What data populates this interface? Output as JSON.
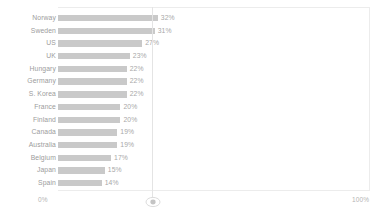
{
  "chart_data": {
    "type": "bar",
    "orientation": "horizontal",
    "title": "",
    "subtitle": "",
    "xlabel": "",
    "ylabel": "",
    "xlim": [
      0,
      100
    ],
    "grid": false,
    "legend": null,
    "bar_color": "#c9c9c9",
    "label_color": "#9c9c9c",
    "value_label_color": "#a8a8a8",
    "axis_color": "#ececec",
    "value_suffix": "%",
    "axis_ticks": [
      {
        "value": 0,
        "label": "0%"
      },
      {
        "value": 100,
        "label": "100%"
      }
    ],
    "categories": [
      "Norway",
      "Sweden",
      "US",
      "UK",
      "Hungary",
      "Germany",
      "S. Korea",
      "France",
      "Finland",
      "Canada",
      "Australia",
      "Belgium",
      "Japan",
      "Spain"
    ],
    "values": [
      32,
      31,
      27,
      23,
      22,
      22,
      22,
      20,
      20,
      19,
      19,
      17,
      15,
      14
    ],
    "data_labels": [
      "32%",
      "31%",
      "27%",
      "23%",
      "22%",
      "22%",
      "22%",
      "20%",
      "20%",
      "19%",
      "19%",
      "17%",
      "15%",
      "14%"
    ],
    "rows": [
      {
        "category": "Norway",
        "value": 32,
        "label": "32%"
      },
      {
        "category": "Sweden",
        "value": 31,
        "label": "31%"
      },
      {
        "category": "US",
        "value": 27,
        "label": "27%"
      },
      {
        "category": "UK",
        "value": 23,
        "label": "23%"
      },
      {
        "category": "Hungary",
        "value": 22,
        "label": "22%"
      },
      {
        "category": "Germany",
        "value": 22,
        "label": "22%"
      },
      {
        "category": "S. Korea",
        "value": 22,
        "label": "22%"
      },
      {
        "category": "France",
        "value": 20,
        "label": "20%"
      },
      {
        "category": "Finland",
        "value": 20,
        "label": "20%"
      },
      {
        "category": "Canada",
        "value": 19,
        "label": "19%"
      },
      {
        "category": "Australia",
        "value": 19,
        "label": "19%"
      },
      {
        "category": "Belgium",
        "value": 17,
        "label": "17%"
      },
      {
        "category": "Japan",
        "value": 15,
        "label": "15%"
      },
      {
        "category": "Spain",
        "value": 14,
        "label": "14%"
      }
    ]
  },
  "controls": {
    "split_handle_icon": "resize-handle-icon",
    "split_position_percent": 30
  }
}
